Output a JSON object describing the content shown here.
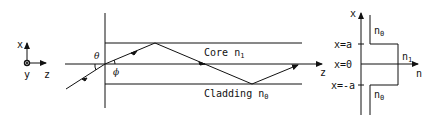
{
  "diagram": {
    "type": "step-index optical waveguide ray diagram",
    "coordinate_system": {
      "x_label": "x",
      "y_label": "y",
      "z_label": "z"
    },
    "angles": {
      "incidence": "θ",
      "refraction": "ϕ"
    },
    "waveguide": {
      "core_label": "Core",
      "core_index": "n",
      "core_index_sub": "1",
      "cladding_label": "Cladding",
      "cladding_index": "n",
      "cladding_index_sub": "0",
      "axis_label": "z"
    },
    "index_profile": {
      "x_axis_label": "x",
      "n_axis_label": "n",
      "tick_top": "x=a",
      "tick_mid": "x=0",
      "tick_bottom": "x=-a",
      "upper_index": "n",
      "upper_index_sub": "0",
      "core_index": "n",
      "core_index_sub": "1",
      "lower_index": "n",
      "lower_index_sub": "0"
    }
  }
}
